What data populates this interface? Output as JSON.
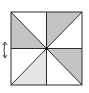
{
  "diagram": {
    "type": "geometry-figure",
    "square": {
      "x1": 11,
      "y1": 12,
      "x2": 82,
      "y2": 85
    },
    "colors": {
      "stroke": "#2b2b2b",
      "shade_dark": "#c4c4c4",
      "shade_light": "#e6e6e6",
      "background": "#ffffff"
    },
    "shaded_triangles": [
      {
        "region": "top-left-lower",
        "shade": "dark"
      },
      {
        "region": "top-right-upper",
        "shade": "dark"
      },
      {
        "region": "bottom-right-upper",
        "shade": "dark"
      },
      {
        "region": "bottom-left-right",
        "shade": "light"
      }
    ],
    "rotation_arrow": {
      "position": "left",
      "direction": "vertical-rotation"
    }
  }
}
